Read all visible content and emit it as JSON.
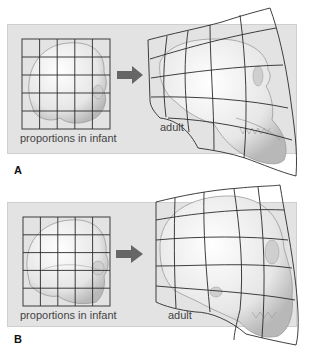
{
  "figure": {
    "panels": [
      {
        "id": "A",
        "label": "A",
        "infant_caption": "proportions in infant",
        "adult_caption": "adult",
        "subject": "primate (chimpanzee) skull"
      },
      {
        "id": "B",
        "label": "B",
        "infant_caption": "proportions in infant",
        "adult_caption": "adult",
        "subject": "human skull"
      }
    ],
    "arrow_icon": "right-arrow-icon",
    "colors": {
      "panel_background": "#e3e3e3",
      "grid_line": "#2a2a2a",
      "skull_fill": "#f2f2f2",
      "skull_shade": "#bdbdbd",
      "arrow": "#666666",
      "text": "#444444"
    }
  }
}
